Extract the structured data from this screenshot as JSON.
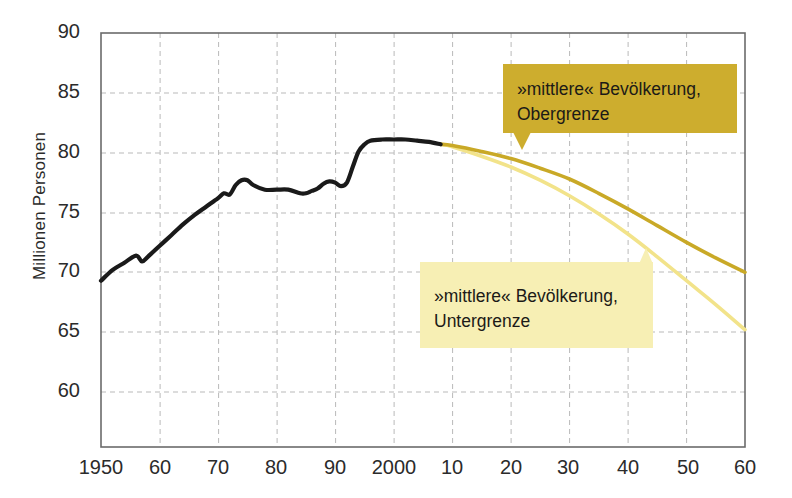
{
  "chart_data": {
    "type": "line",
    "title": "",
    "xlabel": "",
    "ylabel": "Millionen Personen",
    "xlim": [
      1950,
      2060
    ],
    "ylim": [
      55.4,
      90
    ],
    "grid": true,
    "legend_position": "annotations",
    "xtick_labels": [
      "1950",
      "60",
      "70",
      "80",
      "90",
      "2000",
      "10",
      "20",
      "30",
      "40",
      "50",
      "60"
    ],
    "xtick_values": [
      1950,
      1960,
      1970,
      1980,
      1990,
      2000,
      2010,
      2020,
      2030,
      2040,
      2050,
      2060
    ],
    "ytick_labels": [
      "90",
      "85",
      "80",
      "75",
      "70",
      "65",
      "60"
    ],
    "ytick_values": [
      90,
      85,
      80,
      75,
      70,
      65,
      60
    ],
    "series": [
      {
        "name": "Bevölkerung (Ist)",
        "color": "#1a1a1a",
        "style": "solid-thick",
        "x": [
          1950,
          1952,
          1954,
          1956,
          1957,
          1958,
          1960,
          1962,
          1964,
          1966,
          1968,
          1970,
          1971,
          1972,
          1973,
          1974,
          1975,
          1976,
          1978,
          1980,
          1982,
          1984,
          1985,
          1986,
          1987,
          1988,
          1989,
          1990,
          1991,
          1992,
          1993,
          1994,
          1995,
          1996,
          1998,
          2000,
          2002,
          2004,
          2006,
          2008
        ],
        "y": [
          69.3,
          70.2,
          70.8,
          71.4,
          70.9,
          71.3,
          72.2,
          73.1,
          74.0,
          74.8,
          75.5,
          76.2,
          76.6,
          76.5,
          77.3,
          77.7,
          77.7,
          77.3,
          76.9,
          76.9,
          76.9,
          76.6,
          76.6,
          76.8,
          77.0,
          77.4,
          77.6,
          77.5,
          77.2,
          77.5,
          78.8,
          80.1,
          80.7,
          81.0,
          81.1,
          81.1,
          81.1,
          81.0,
          80.9,
          80.7
        ],
        "note": "historische Entwicklung, schwarze Linie"
      },
      {
        "name": "»mittlere« Bevölkerung, Obergrenze",
        "color": "#c9a927",
        "style": "solid",
        "x": [
          2008,
          2010,
          2015,
          2020,
          2025,
          2030,
          2035,
          2040,
          2045,
          2050,
          2055,
          2060
        ],
        "y": [
          80.7,
          80.6,
          80.1,
          79.5,
          78.7,
          77.8,
          76.6,
          75.3,
          73.9,
          72.5,
          71.2,
          70.0
        ]
      },
      {
        "name": "»mittlere« Bevölkerung, Untergrenze",
        "color": "#f2e38a",
        "style": "solid",
        "x": [
          2008,
          2010,
          2015,
          2020,
          2025,
          2030,
          2035,
          2040,
          2045,
          2050,
          2055,
          2060
        ],
        "y": [
          80.7,
          80.5,
          79.7,
          78.8,
          77.7,
          76.4,
          74.9,
          73.2,
          71.3,
          69.3,
          67.3,
          65.2
        ]
      }
    ],
    "annotations": [
      {
        "id": "obergrenze",
        "lines": [
          "»mittlere« Bevölkerung,",
          "Obergrenze"
        ],
        "fill_color": "#cdad2e",
        "points_to": 2022
      },
      {
        "id": "untergrenze",
        "lines": [
          "»mittlere« Bevölkerung,",
          "Untergrenze"
        ],
        "fill_color": "#f7efb4",
        "points_to": 2043
      }
    ]
  },
  "axes": {
    "y_axis_title": "Millionen Personen",
    "frame_color": "#6b6b6b",
    "grid_color": "#b9b9b9"
  }
}
